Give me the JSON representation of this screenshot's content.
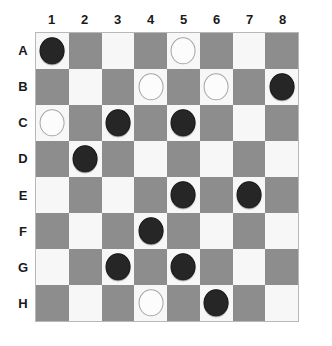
{
  "board": {
    "title": "Checkers Board",
    "rows": 8,
    "cols": 8,
    "column_labels": [
      "1",
      "2",
      "3",
      "4",
      "5",
      "6",
      "7",
      "8"
    ],
    "row_labels": [
      "A",
      "B",
      "C",
      "D",
      "E",
      "F",
      "G",
      "H"
    ],
    "colors": {
      "light_square": "#f7f7f7",
      "dark_square": "#8d8d8d",
      "black_piece": "#262626",
      "white_piece": "#fcfcfc",
      "white_piece_outline": "#a5a5a5",
      "border": "#b8b8b8",
      "label_text": "#1a1a1a",
      "page_background": "#ffffff"
    },
    "light_square_parity": "A1 is light",
    "squares": [
      [
        {
          "id": "A1",
          "shade": "light",
          "piece": "black"
        },
        {
          "id": "A2",
          "shade": "dark",
          "piece": null
        },
        {
          "id": "A3",
          "shade": "light",
          "piece": null
        },
        {
          "id": "A4",
          "shade": "dark",
          "piece": null
        },
        {
          "id": "A5",
          "shade": "light",
          "piece": "white"
        },
        {
          "id": "A6",
          "shade": "dark",
          "piece": null
        },
        {
          "id": "A7",
          "shade": "light",
          "piece": null
        },
        {
          "id": "A8",
          "shade": "dark",
          "piece": null
        }
      ],
      [
        {
          "id": "B1",
          "shade": "dark",
          "piece": null
        },
        {
          "id": "B2",
          "shade": "light",
          "piece": null
        },
        {
          "id": "B3",
          "shade": "dark",
          "piece": null
        },
        {
          "id": "B4",
          "shade": "light",
          "piece": "white"
        },
        {
          "id": "B5",
          "shade": "dark",
          "piece": null
        },
        {
          "id": "B6",
          "shade": "light",
          "piece": "white"
        },
        {
          "id": "B7",
          "shade": "dark",
          "piece": null
        },
        {
          "id": "B8",
          "shade": "light",
          "piece": "black"
        }
      ],
      [
        {
          "id": "C1",
          "shade": "light",
          "piece": "white"
        },
        {
          "id": "C2",
          "shade": "dark",
          "piece": null
        },
        {
          "id": "C3",
          "shade": "light",
          "piece": "black"
        },
        {
          "id": "C4",
          "shade": "dark",
          "piece": null
        },
        {
          "id": "C5",
          "shade": "light",
          "piece": "black"
        },
        {
          "id": "C6",
          "shade": "dark",
          "piece": null
        },
        {
          "id": "C7",
          "shade": "light",
          "piece": null
        },
        {
          "id": "C8",
          "shade": "dark",
          "piece": null
        }
      ],
      [
        {
          "id": "D1",
          "shade": "dark",
          "piece": null
        },
        {
          "id": "D2",
          "shade": "light",
          "piece": "black"
        },
        {
          "id": "D3",
          "shade": "dark",
          "piece": null
        },
        {
          "id": "D4",
          "shade": "light",
          "piece": null
        },
        {
          "id": "D5",
          "shade": "dark",
          "piece": null
        },
        {
          "id": "D6",
          "shade": "light",
          "piece": null
        },
        {
          "id": "D7",
          "shade": "dark",
          "piece": null
        },
        {
          "id": "D8",
          "shade": "light",
          "piece": null
        }
      ],
      [
        {
          "id": "E1",
          "shade": "light",
          "piece": null
        },
        {
          "id": "E2",
          "shade": "dark",
          "piece": null
        },
        {
          "id": "E3",
          "shade": "light",
          "piece": null
        },
        {
          "id": "E4",
          "shade": "dark",
          "piece": null
        },
        {
          "id": "E5",
          "shade": "light",
          "piece": "black"
        },
        {
          "id": "E6",
          "shade": "dark",
          "piece": null
        },
        {
          "id": "E7",
          "shade": "light",
          "piece": "black"
        },
        {
          "id": "E8",
          "shade": "dark",
          "piece": null
        }
      ],
      [
        {
          "id": "F1",
          "shade": "dark",
          "piece": null
        },
        {
          "id": "F2",
          "shade": "light",
          "piece": null
        },
        {
          "id": "F3",
          "shade": "dark",
          "piece": null
        },
        {
          "id": "F4",
          "shade": "light",
          "piece": "black"
        },
        {
          "id": "F5",
          "shade": "dark",
          "piece": null
        },
        {
          "id": "F6",
          "shade": "light",
          "piece": null
        },
        {
          "id": "F7",
          "shade": "dark",
          "piece": null
        },
        {
          "id": "F8",
          "shade": "light",
          "piece": null
        }
      ],
      [
        {
          "id": "G1",
          "shade": "light",
          "piece": null
        },
        {
          "id": "G2",
          "shade": "dark",
          "piece": null
        },
        {
          "id": "G3",
          "shade": "light",
          "piece": "black"
        },
        {
          "id": "G4",
          "shade": "dark",
          "piece": null
        },
        {
          "id": "G5",
          "shade": "light",
          "piece": "black"
        },
        {
          "id": "G6",
          "shade": "dark",
          "piece": null
        },
        {
          "id": "G7",
          "shade": "light",
          "piece": null
        },
        {
          "id": "G8",
          "shade": "dark",
          "piece": null
        }
      ],
      [
        {
          "id": "H1",
          "shade": "dark",
          "piece": null
        },
        {
          "id": "H2",
          "shade": "light",
          "piece": null
        },
        {
          "id": "H3",
          "shade": "dark",
          "piece": null
        },
        {
          "id": "H4",
          "shade": "light",
          "piece": "white"
        },
        {
          "id": "H5",
          "shade": "dark",
          "piece": null
        },
        {
          "id": "H6",
          "shade": "light",
          "piece": "black"
        },
        {
          "id": "H7",
          "shade": "dark",
          "piece": null
        },
        {
          "id": "H8",
          "shade": "light",
          "piece": null
        }
      ]
    ],
    "black_pieces": [
      "A1",
      "B8",
      "C3",
      "C5",
      "D2",
      "E5",
      "E7",
      "F4",
      "G3",
      "G5",
      "H6"
    ],
    "white_pieces": [
      "A5",
      "B4",
      "B6",
      "C1",
      "H4"
    ],
    "black_piece_count": 11,
    "white_piece_count": 5
  }
}
